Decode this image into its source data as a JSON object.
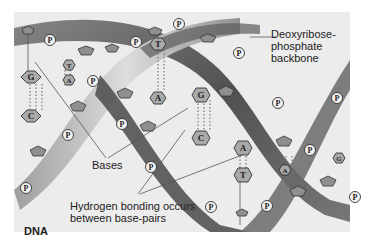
{
  "diagram": {
    "title": "DNA",
    "labels": {
      "backbone": "Deoxyribose-phosphate backbone",
      "bases": "Bases",
      "hydrogen_bonding": "Hydrogen bonding occurs between base-pairs"
    },
    "phosphate_symbol": "P",
    "base_pairs": [
      {
        "top": "G",
        "bottom": "C"
      },
      {
        "top": "T",
        "bottom": "A"
      },
      {
        "top": "T",
        "bottom": "A"
      },
      {
        "top": "G",
        "bottom": "C"
      },
      {
        "top": "A",
        "bottom": "T"
      },
      {
        "top": "A",
        "bottom": ""
      },
      {
        "top": "G",
        "bottom": ""
      }
    ],
    "colors": {
      "background": "#ececec",
      "strand_dark": "#5a5a5a",
      "strand_light": "#b8b8b8",
      "base_fill": "#a9a9a9",
      "phosphate_fill": "#f2f2f2",
      "text": "#222222"
    }
  }
}
